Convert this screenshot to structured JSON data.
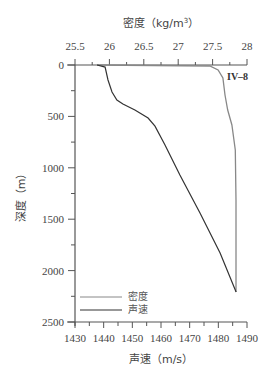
{
  "chart_data": {
    "type": "line",
    "title": "",
    "station_label": "IV–8",
    "top_axis": {
      "label": "密度（kg/m³）",
      "label_text": "密度（kg/m",
      "label_sup": "3",
      "label_close": "）",
      "ticks": [
        "25.5",
        "26",
        "26.5",
        "27",
        "27.5",
        "28"
      ],
      "range": [
        25.5,
        28
      ]
    },
    "bottom_axis": {
      "label": "声速（m/s）",
      "ticks": [
        "1430",
        "1440",
        "1450",
        "1460",
        "1470",
        "1480",
        "1490"
      ],
      "range": [
        1430,
        1490
      ]
    },
    "y_axis": {
      "label": "深度（m）",
      "ticks": [
        "0",
        "500",
        "1000",
        "1500",
        "2000",
        "2500"
      ],
      "range": [
        0,
        2500
      ],
      "inverted": true
    },
    "legend": [
      {
        "name": "密度",
        "color": "#888888"
      },
      {
        "name": "声速",
        "color": "#333333"
      }
    ],
    "series": [
      {
        "name": "声速",
        "axis": "bottom",
        "color": "#333333",
        "points": [
          {
            "value": 1437.7,
            "depth": 0
          },
          {
            "value": 1440.5,
            "depth": 20
          },
          {
            "value": 1441.5,
            "depth": 146
          },
          {
            "value": 1442.9,
            "depth": 263
          },
          {
            "value": 1444.6,
            "depth": 340
          },
          {
            "value": 1446.7,
            "depth": 380
          },
          {
            "value": 1450.9,
            "depth": 438
          },
          {
            "value": 1455.5,
            "depth": 516
          },
          {
            "value": 1457.9,
            "depth": 594
          },
          {
            "value": 1461.4,
            "depth": 778
          },
          {
            "value": 1466.6,
            "depth": 1070
          },
          {
            "value": 1473.6,
            "depth": 1440
          },
          {
            "value": 1480.6,
            "depth": 1829
          },
          {
            "value": 1486.2,
            "depth": 2209
          }
        ]
      },
      {
        "name": "密度",
        "axis": "top",
        "color": "#888888",
        "points": [
          {
            "value": 25.82,
            "depth": 0
          },
          {
            "value": 27.46,
            "depth": 10
          },
          {
            "value": 27.58,
            "depth": 49
          },
          {
            "value": 27.65,
            "depth": 126
          },
          {
            "value": 27.68,
            "depth": 292
          },
          {
            "value": 27.72,
            "depth": 438
          },
          {
            "value": 27.78,
            "depth": 584
          },
          {
            "value": 27.83,
            "depth": 827
          },
          {
            "value": 27.84,
            "depth": 1314
          },
          {
            "value": 27.84,
            "depth": 2209
          }
        ]
      }
    ],
    "grid": false
  }
}
